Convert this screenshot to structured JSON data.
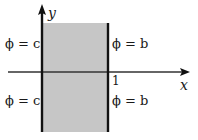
{
  "diagram": {
    "axes": {
      "x_label": "x",
      "y_label": "y"
    },
    "tick": {
      "x_one": "1"
    },
    "region": {
      "fill_color": "#c6c6c6",
      "x_range": [
        0,
        1
      ],
      "description": "shaded strip 0 < x < 1"
    },
    "boundary_labels": {
      "left_upper": "ϕ = c",
      "left_lower": "ϕ = c",
      "right_upper": "ϕ = b",
      "right_lower": "ϕ = b"
    },
    "colors": {
      "axis": "#111111",
      "region": "#c6c6c6",
      "background": "#ffffff"
    }
  }
}
